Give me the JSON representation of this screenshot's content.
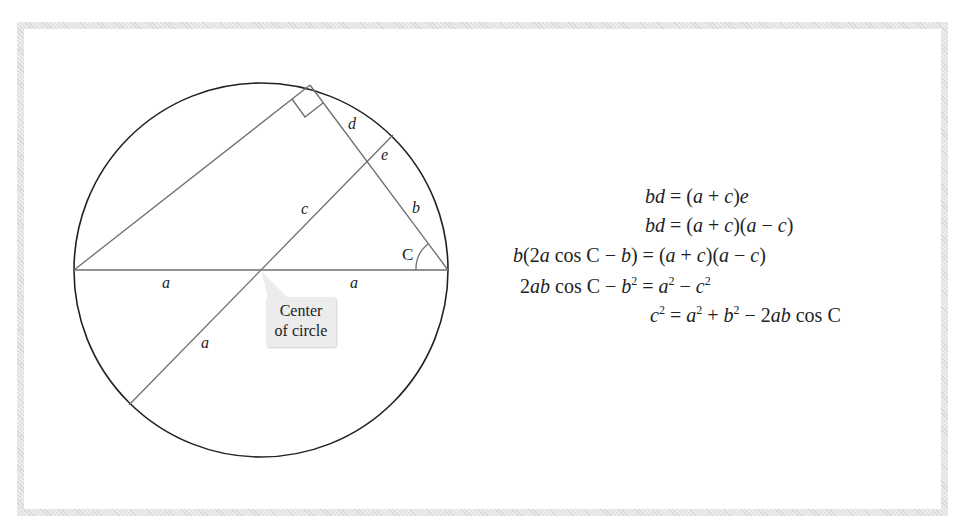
{
  "figure": {
    "circle": {
      "cx": 261,
      "cy": 270,
      "r": 187
    },
    "labels": {
      "d": "d",
      "e": "e",
      "c": "c",
      "b": "b",
      "angle": "C",
      "a_left": "a",
      "a_right": "a",
      "a_lower": "a"
    },
    "callout": {
      "line1": "Center",
      "line2": "of circle"
    }
  },
  "equations": [
    {
      "lhs": "bd",
      "rhs": "(a + c)e"
    },
    {
      "lhs": "bd",
      "rhs": "(a + c)(a − c)"
    },
    {
      "lhs": "b(2a cos C − b)",
      "rhs": "(a + c)(a − c)"
    },
    {
      "lhs": "2ab cos C − b²",
      "rhs": "a² − c²"
    },
    {
      "lhs": "c²",
      "rhs": "a² + b² − 2ab cos C"
    }
  ],
  "colors": {
    "frame": "#e2e2e2",
    "circle_stroke": "#222222",
    "line_stroke": "#6e6e6e",
    "callout_bg": "#ececec"
  }
}
